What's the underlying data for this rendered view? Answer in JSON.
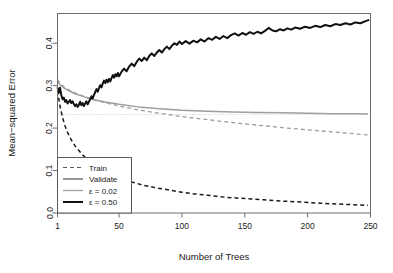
{
  "chart_data": {
    "type": "line",
    "title": "",
    "xlabel": "Number of Trees",
    "ylabel": "Mean−squared Error",
    "xlim": [
      1,
      250
    ],
    "ylim": [
      0.0,
      0.47
    ],
    "xticks": [
      1,
      50,
      100,
      150,
      200,
      250
    ],
    "xtick_labels": [
      "1",
      "50",
      "100",
      "150",
      "200",
      "250"
    ],
    "yticks": [
      0.0,
      0.1,
      0.2,
      0.3,
      0.4
    ],
    "ytick_labels": [
      "0.0",
      "0.1",
      "0.2",
      "0.3",
      "0.4"
    ],
    "grid": false,
    "legend_position": "bottom-left",
    "legend_entries": [
      {
        "label": "Train",
        "style": "dashed",
        "color": "#555555",
        "width": 1.2
      },
      {
        "label": "Validate",
        "style": "solid",
        "color": "#555555",
        "width": 1.2
      },
      {
        "label": "ε = 0.02",
        "style": "solid",
        "color": "#a8a8a8",
        "width": 1.4
      },
      {
        "label": "ε = 0.50",
        "style": "solid",
        "color": "#111111",
        "width": 2.0
      }
    ],
    "reference_line": {
      "y": 0.232,
      "style": "dotted",
      "color": "#c8c8c8"
    },
    "series": [
      {
        "name": "Train ε = 0.50",
        "style": "dashed",
        "color": "#1a1a1a",
        "width": 1.5,
        "x": [
          1,
          3,
          5,
          7,
          9,
          12,
          15,
          18,
          22,
          26,
          30,
          35,
          40,
          45,
          50,
          60,
          70,
          80,
          90,
          100,
          110,
          120,
          135,
          150,
          165,
          180,
          195,
          210,
          225,
          240,
          248
        ],
        "y": [
          0.288,
          0.252,
          0.225,
          0.205,
          0.19,
          0.172,
          0.158,
          0.147,
          0.134,
          0.123,
          0.114,
          0.104,
          0.096,
          0.089,
          0.083,
          0.073,
          0.065,
          0.059,
          0.054,
          0.049,
          0.045,
          0.042,
          0.037,
          0.034,
          0.031,
          0.028,
          0.026,
          0.023,
          0.021,
          0.019,
          0.018
        ]
      },
      {
        "name": "Train ε = 0.02",
        "style": "dashed",
        "color": "#9e9e9e",
        "width": 1.3,
        "x": [
          1,
          3,
          6,
          10,
          15,
          20,
          25,
          30,
          40,
          50,
          65,
          80,
          100,
          120,
          140,
          160,
          180,
          200,
          220,
          240,
          248
        ],
        "y": [
          0.315,
          0.306,
          0.298,
          0.29,
          0.283,
          0.277,
          0.272,
          0.267,
          0.259,
          0.252,
          0.243,
          0.236,
          0.227,
          0.22,
          0.213,
          0.207,
          0.201,
          0.196,
          0.191,
          0.186,
          0.184
        ]
      },
      {
        "name": "Validate ε = 0.02",
        "style": "solid",
        "color": "#9e9e9e",
        "width": 1.5,
        "x": [
          1,
          3,
          6,
          10,
          15,
          20,
          25,
          30,
          40,
          50,
          65,
          80,
          100,
          120,
          140,
          160,
          180,
          200,
          220,
          240,
          248
        ],
        "y": [
          0.31,
          0.302,
          0.295,
          0.288,
          0.281,
          0.276,
          0.271,
          0.267,
          0.261,
          0.256,
          0.25,
          0.246,
          0.242,
          0.24,
          0.238,
          0.237,
          0.236,
          0.235,
          0.234,
          0.234,
          0.233
        ]
      },
      {
        "name": "Validate ε = 0.50",
        "style": "solid",
        "color": "#111111",
        "width": 2.0,
        "x": [
          1,
          2,
          3,
          4,
          5,
          6,
          7,
          8,
          9,
          10,
          11,
          12,
          13,
          14,
          15,
          16,
          17,
          18,
          19,
          20,
          21,
          22,
          23,
          24,
          25,
          26,
          27,
          28,
          29,
          30,
          31,
          32,
          33,
          34,
          35,
          36,
          37,
          38,
          39,
          40,
          41,
          42,
          43,
          44,
          45,
          46,
          47,
          48,
          49,
          50,
          52,
          54,
          56,
          58,
          60,
          62,
          64,
          66,
          68,
          70,
          72,
          74,
          76,
          78,
          80,
          82,
          84,
          86,
          88,
          90,
          92,
          94,
          96,
          98,
          100,
          103,
          106,
          109,
          112,
          115,
          118,
          121,
          124,
          127,
          130,
          133,
          136,
          139,
          142,
          145,
          148,
          151,
          154,
          157,
          160,
          163,
          166,
          169,
          172,
          175,
          178,
          181,
          184,
          187,
          190,
          194,
          198,
          202,
          206,
          210,
          214,
          218,
          222,
          226,
          230,
          234,
          238,
          242,
          246,
          249
        ],
        "y": [
          0.296,
          0.283,
          0.295,
          0.278,
          0.268,
          0.272,
          0.262,
          0.266,
          0.258,
          0.262,
          0.266,
          0.259,
          0.263,
          0.257,
          0.252,
          0.256,
          0.25,
          0.255,
          0.262,
          0.254,
          0.259,
          0.252,
          0.258,
          0.263,
          0.256,
          0.262,
          0.268,
          0.275,
          0.27,
          0.278,
          0.285,
          0.292,
          0.286,
          0.294,
          0.301,
          0.296,
          0.305,
          0.312,
          0.306,
          0.314,
          0.308,
          0.316,
          0.31,
          0.318,
          0.325,
          0.319,
          0.327,
          0.322,
          0.33,
          0.322,
          0.333,
          0.34,
          0.334,
          0.345,
          0.352,
          0.346,
          0.356,
          0.364,
          0.358,
          0.366,
          0.36,
          0.37,
          0.376,
          0.37,
          0.378,
          0.384,
          0.378,
          0.386,
          0.392,
          0.386,
          0.394,
          0.4,
          0.396,
          0.404,
          0.398,
          0.405,
          0.399,
          0.406,
          0.402,
          0.409,
          0.404,
          0.412,
          0.408,
          0.415,
          0.41,
          0.417,
          0.412,
          0.419,
          0.423,
          0.418,
          0.424,
          0.42,
          0.426,
          0.422,
          0.427,
          0.423,
          0.429,
          0.436,
          0.43,
          0.428,
          0.433,
          0.43,
          0.435,
          0.432,
          0.437,
          0.434,
          0.439,
          0.436,
          0.441,
          0.438,
          0.443,
          0.44,
          0.445,
          0.443,
          0.447,
          0.444,
          0.449,
          0.447,
          0.452,
          0.455
        ]
      }
    ]
  }
}
